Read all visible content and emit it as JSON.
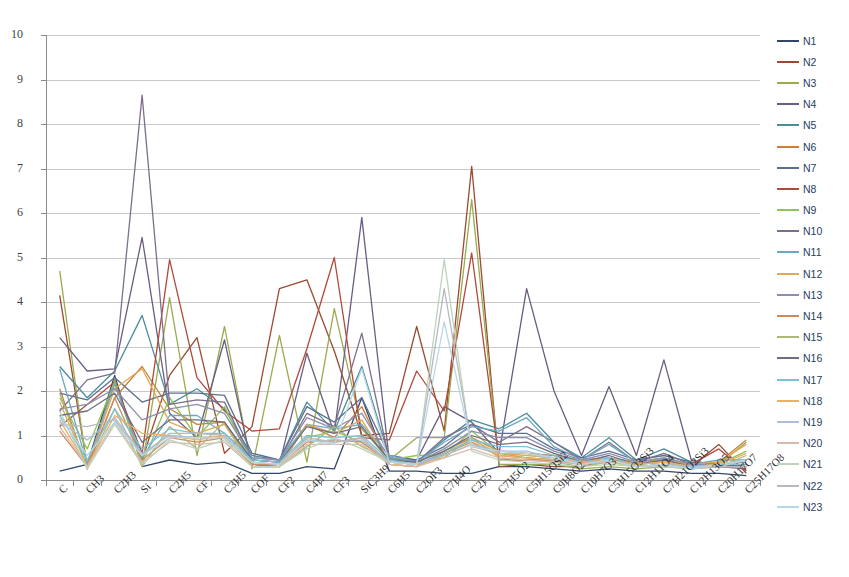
{
  "chart_data": {
    "type": "line",
    "title": "",
    "xlabel": "",
    "ylabel": "",
    "ylim": [
      0,
      10
    ],
    "yticks": [
      0,
      1,
      2,
      3,
      4,
      5,
      6,
      7,
      8,
      9,
      10
    ],
    "grid": true,
    "legend_position": "right",
    "categories": [
      "C",
      "CH3",
      "C2H3",
      "Si",
      "C2H5",
      "CF",
      "C3H5",
      "COF",
      "CF2",
      "C4H7",
      "CF3",
      "SiC3H9",
      "C6H5",
      "C2OF3",
      "C7H4O",
      "C2F5",
      "C7H5O2",
      "C5H15OSi2",
      "C9H8O2",
      "C10H7O3",
      "C5H15O3Si3",
      "C12H11O4",
      "C7H21O2Si3",
      "C12H13O5",
      "C20H17O7",
      "C25H17O8"
    ],
    "series": [
      {
        "name": "N1",
        "color": "#31486b",
        "values": [
          0.2,
          0.35,
          2.35,
          0.3,
          0.45,
          0.35,
          0.4,
          0.15,
          0.15,
          0.3,
          0.25,
          1.85,
          0.2,
          0.2,
          0.15,
          0.15,
          0.3,
          0.3,
          0.25,
          0.2,
          0.25,
          0.2,
          0.2,
          0.15,
          0.15,
          0.1
        ]
      },
      {
        "name": "N2",
        "color": "#9a4a31",
        "values": [
          4.15,
          0.3,
          2.25,
          0.45,
          2.35,
          3.2,
          0.6,
          1.2,
          4.3,
          4.5,
          2.9,
          1.0,
          1.05,
          3.45,
          1.1,
          7.05,
          0.3,
          0.35,
          0.3,
          0.3,
          0.45,
          0.3,
          0.35,
          0.3,
          0.8,
          0.15
        ]
      },
      {
        "name": "N3",
        "color": "#9aab50",
        "values": [
          4.7,
          0.25,
          2.25,
          0.3,
          4.1,
          0.55,
          3.45,
          0.25,
          3.25,
          0.4,
          3.85,
          1.15,
          0.45,
          0.95,
          0.95,
          6.3,
          0.35,
          0.35,
          0.35,
          0.25,
          0.3,
          0.25,
          0.3,
          0.25,
          0.35,
          0.85
        ]
      },
      {
        "name": "N4",
        "color": "#6b5d82",
        "values": [
          3.2,
          2.45,
          2.5,
          5.45,
          1.5,
          0.95,
          3.15,
          0.3,
          0.35,
          2.85,
          1.05,
          5.9,
          0.45,
          0.45,
          1.65,
          1.3,
          0.6,
          4.3,
          2.0,
          0.55,
          2.1,
          0.55,
          2.7,
          0.45,
          0.3,
          0.25
        ]
      },
      {
        "name": "N5",
        "color": "#4a8e99",
        "values": [
          2.55,
          1.85,
          2.45,
          3.7,
          1.7,
          2.05,
          1.6,
          0.55,
          0.45,
          1.75,
          1.1,
          2.55,
          0.5,
          0.4,
          0.9,
          1.35,
          1.15,
          1.5,
          0.85,
          0.5,
          0.95,
          0.45,
          0.7,
          0.4,
          0.3,
          0.35
        ]
      },
      {
        "name": "N6",
        "color": "#c8823c",
        "values": [
          2.05,
          0.25,
          1.85,
          2.55,
          1.6,
          1.25,
          1.3,
          0.35,
          0.3,
          1.25,
          0.95,
          1.65,
          0.35,
          0.3,
          0.65,
          0.95,
          0.65,
          0.6,
          0.55,
          0.45,
          0.5,
          0.4,
          0.45,
          0.35,
          0.4,
          0.9
        ]
      },
      {
        "name": "N7",
        "color": "#5d6f8f",
        "values": [
          1.95,
          1.8,
          2.3,
          1.75,
          1.95,
          1.95,
          1.9,
          0.6,
          0.45,
          1.65,
          1.3,
          1.85,
          0.55,
          0.45,
          0.75,
          1.25,
          1.05,
          1.05,
          0.7,
          0.5,
          0.65,
          0.45,
          0.55,
          0.4,
          0.35,
          0.45
        ]
      },
      {
        "name": "N8",
        "color": "#b04a3c",
        "values": [
          1.2,
          1.7,
          2.2,
          0.6,
          4.95,
          2.3,
          1.55,
          1.1,
          1.15,
          2.95,
          5.0,
          0.95,
          0.9,
          2.45,
          1.55,
          5.1,
          0.45,
          0.45,
          0.45,
          0.4,
          0.45,
          0.4,
          0.45,
          0.35,
          0.7,
          0.2
        ]
      },
      {
        "name": "N9",
        "color": "#90c35a",
        "values": [
          1.85,
          0.7,
          2.2,
          0.35,
          1.85,
          0.95,
          1.65,
          0.35,
          0.35,
          0.95,
          1.1,
          0.85,
          0.45,
          0.55,
          0.55,
          1.1,
          0.6,
          0.5,
          0.45,
          0.35,
          0.45,
          0.35,
          0.4,
          0.3,
          0.35,
          0.65
        ]
      },
      {
        "name": "N10",
        "color": "#7c6e8c",
        "values": [
          1.55,
          2.25,
          2.4,
          8.65,
          1.7,
          1.8,
          1.75,
          0.45,
          0.4,
          1.5,
          1.2,
          3.3,
          0.45,
          0.4,
          0.95,
          1.25,
          0.85,
          1.2,
          0.85,
          0.45,
          0.85,
          0.4,
          0.6,
          0.35,
          0.3,
          0.3
        ]
      },
      {
        "name": "N11",
        "color": "#6fa8c4",
        "values": [
          2.5,
          0.35,
          2.15,
          0.5,
          1.45,
          1.45,
          1.05,
          0.5,
          0.45,
          1.25,
          1.15,
          1.25,
          0.55,
          0.4,
          0.85,
          1.2,
          1.1,
          1.4,
          0.75,
          0.45,
          0.8,
          0.4,
          0.5,
          0.35,
          0.45,
          0.45
        ]
      },
      {
        "name": "N12",
        "color": "#e0a857",
        "values": [
          1.75,
          0.3,
          2.05,
          2.5,
          1.3,
          1.05,
          1.25,
          0.3,
          0.3,
          1.25,
          1.05,
          1.35,
          0.35,
          0.3,
          0.6,
          0.9,
          0.6,
          0.55,
          0.5,
          0.45,
          0.5,
          0.4,
          0.45,
          0.35,
          0.4,
          0.8
        ]
      },
      {
        "name": "N13",
        "color": "#8a8fae",
        "values": [
          1.6,
          1.7,
          2.05,
          1.35,
          1.6,
          1.7,
          1.5,
          0.5,
          0.45,
          1.4,
          1.15,
          1.5,
          0.5,
          0.4,
          0.7,
          1.1,
          0.95,
          0.95,
          0.65,
          0.45,
          0.6,
          0.4,
          0.5,
          0.35,
          0.35,
          0.4
        ]
      },
      {
        "name": "N14",
        "color": "#d08a5e",
        "values": [
          1.1,
          0.3,
          1.85,
          0.45,
          0.95,
          0.85,
          0.95,
          0.35,
          0.35,
          0.85,
          0.9,
          0.85,
          0.4,
          0.35,
          0.6,
          0.85,
          0.55,
          0.5,
          0.45,
          0.35,
          0.45,
          0.35,
          0.4,
          0.3,
          0.35,
          0.3
        ]
      },
      {
        "name": "N15",
        "color": "#aab97a",
        "values": [
          1.95,
          0.25,
          1.6,
          0.3,
          1.2,
          0.7,
          1.3,
          0.3,
          0.3,
          0.75,
          1.2,
          0.75,
          0.45,
          0.4,
          0.5,
          0.95,
          0.5,
          0.45,
          0.4,
          0.3,
          0.4,
          0.3,
          0.35,
          0.3,
          0.3,
          0.55
        ]
      },
      {
        "name": "N16",
        "color": "#6d6d82",
        "values": [
          1.45,
          1.55,
          1.95,
          0.85,
          1.35,
          1.35,
          1.3,
          0.45,
          0.4,
          1.2,
          1.05,
          1.2,
          0.45,
          0.4,
          0.65,
          1.0,
          0.8,
          0.85,
          0.6,
          0.4,
          0.55,
          0.35,
          0.45,
          0.3,
          0.3,
          0.35
        ]
      },
      {
        "name": "N17",
        "color": "#7fc0d4",
        "values": [
          1.45,
          0.45,
          1.6,
          0.7,
          1.15,
          1.05,
          1.05,
          0.45,
          0.4,
          1.0,
          0.95,
          1.0,
          0.45,
          0.35,
          0.6,
          0.9,
          0.75,
          0.75,
          0.55,
          0.4,
          0.5,
          0.35,
          0.4,
          0.3,
          0.35,
          0.35
        ]
      },
      {
        "name": "N18",
        "color": "#f0ae63",
        "values": [
          1.35,
          0.3,
          1.45,
          1.05,
          1.0,
          0.9,
          1.0,
          0.3,
          0.3,
          0.9,
          0.85,
          0.95,
          0.35,
          0.3,
          0.55,
          0.8,
          0.55,
          0.5,
          0.45,
          0.4,
          0.45,
          0.35,
          0.4,
          0.3,
          0.35,
          0.6
        ]
      },
      {
        "name": "N19",
        "color": "#a9c0d8",
        "values": [
          1.3,
          0.9,
          1.4,
          0.6,
          1.0,
          0.95,
          0.95,
          0.4,
          0.35,
          0.9,
          0.85,
          0.9,
          0.4,
          0.35,
          0.55,
          0.8,
          0.65,
          0.65,
          0.5,
          0.35,
          0.45,
          0.3,
          0.35,
          0.3,
          0.3,
          0.3
        ]
      },
      {
        "name": "N20",
        "color": "#d9b9a9",
        "values": [
          1.2,
          0.3,
          1.3,
          0.4,
          0.85,
          0.8,
          0.85,
          0.3,
          0.3,
          0.8,
          0.8,
          0.8,
          0.35,
          0.3,
          0.5,
          0.7,
          0.5,
          0.45,
          0.4,
          0.35,
          0.4,
          0.3,
          0.35,
          0.25,
          0.3,
          0.3
        ]
      },
      {
        "name": "N21",
        "color": "#bcd3bc",
        "values": [
          1.55,
          0.25,
          1.25,
          0.35,
          0.9,
          0.7,
          0.9,
          0.3,
          0.3,
          0.7,
          0.95,
          0.7,
          0.4,
          0.35,
          4.95,
          0.65,
          0.45,
          0.4,
          0.35,
          0.3,
          0.35,
          0.3,
          0.3,
          0.25,
          0.3,
          0.45
        ]
      },
      {
        "name": "N22",
        "color": "#b8b8c0",
        "values": [
          1.25,
          1.2,
          1.35,
          0.55,
          1.05,
          1.05,
          1.0,
          0.4,
          0.35,
          0.95,
          0.85,
          0.95,
          0.4,
          0.35,
          4.3,
          0.75,
          0.6,
          0.6,
          0.45,
          0.35,
          0.45,
          0.3,
          0.35,
          0.25,
          0.3,
          0.3
        ]
      },
      {
        "name": "N23",
        "color": "#b6d7e4",
        "values": [
          1.4,
          0.55,
          1.3,
          0.55,
          0.95,
          0.95,
          0.95,
          0.4,
          0.35,
          0.9,
          0.8,
          2.5,
          0.4,
          0.35,
          3.55,
          0.75,
          0.65,
          0.6,
          0.5,
          0.35,
          0.45,
          0.3,
          0.35,
          0.25,
          0.35,
          0.45
        ]
      }
    ]
  }
}
